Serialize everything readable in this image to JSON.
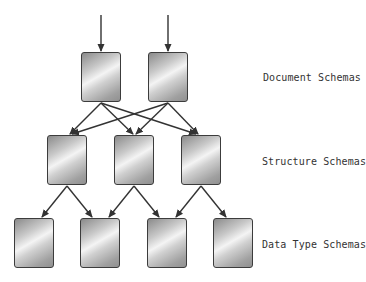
{
  "diagram": {
    "levels": [
      {
        "label": "Document Schemas",
        "label_pos": [
          263,
          72
        ],
        "boxes": [
          [
            81,
            52
          ],
          [
            148,
            52
          ]
        ]
      },
      {
        "label": "Structure Schemas",
        "label_pos": [
          262,
          156
        ],
        "boxes": [
          [
            47,
            135
          ],
          [
            114,
            135
          ],
          [
            181,
            135
          ]
        ]
      },
      {
        "label": "Data Type Schemas",
        "label_pos": [
          262,
          239
        ],
        "boxes": [
          [
            14,
            218
          ],
          [
            80,
            218
          ],
          [
            147,
            218
          ],
          [
            213,
            218
          ]
        ]
      }
    ],
    "input_arrows": [
      [
        101,
        15,
        101,
        51
      ],
      [
        168,
        15,
        168,
        51
      ]
    ],
    "edges": [
      [
        101,
        103,
        70,
        134
      ],
      [
        101,
        103,
        133,
        134
      ],
      [
        101,
        103,
        196,
        134
      ],
      [
        168,
        103,
        72,
        134
      ],
      [
        168,
        103,
        136,
        134
      ],
      [
        168,
        103,
        198,
        134
      ],
      [
        67,
        186,
        42,
        217
      ],
      [
        67,
        186,
        92,
        217
      ],
      [
        134,
        186,
        109,
        217
      ],
      [
        134,
        186,
        159,
        217
      ],
      [
        201,
        186,
        176,
        217
      ],
      [
        201,
        186,
        226,
        217
      ]
    ],
    "colors": {
      "stroke": "#333333",
      "border": "#3c3c3c",
      "text": "#333333"
    }
  }
}
